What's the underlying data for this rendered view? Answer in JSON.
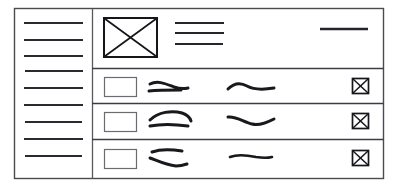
{
  "sketch": {
    "title": "Mobile app list screen wireframe",
    "style": "hand-drawn-lo-fi",
    "background_color": "#ffffff",
    "ink_color": "#18181d",
    "frame": {
      "x": 14,
      "y": 8,
      "width": 370,
      "height": 171
    }
  },
  "sidebar": {
    "name": "navigation-rail",
    "divider_x": 92,
    "menu_item_count": 9,
    "items": [
      {
        "label": "",
        "glyph": "nav-line",
        "y": 23,
        "x1": 24,
        "x2": 83
      },
      {
        "label": "",
        "glyph": "nav-line",
        "y": 40,
        "x1": 24,
        "x2": 83
      },
      {
        "label": "",
        "glyph": "nav-line",
        "y": 56,
        "x1": 24,
        "x2": 83
      },
      {
        "label": "",
        "glyph": "nav-line",
        "y": 71,
        "x1": 25,
        "x2": 83
      },
      {
        "label": "",
        "glyph": "nav-line",
        "y": 88,
        "x1": 24,
        "x2": 83
      },
      {
        "label": "",
        "glyph": "nav-line",
        "y": 105,
        "x1": 24,
        "x2": 83
      },
      {
        "label": "",
        "glyph": "nav-line",
        "y": 122,
        "x1": 25,
        "x2": 82
      },
      {
        "label": "",
        "glyph": "nav-line",
        "y": 139,
        "x1": 24,
        "x2": 83
      },
      {
        "label": "",
        "glyph": "nav-line",
        "y": 156,
        "x1": 25,
        "x2": 82
      }
    ]
  },
  "header": {
    "name": "content-header",
    "region": {
      "x": 92,
      "y": 8,
      "width": 292,
      "height": 60
    },
    "image_placeholder": {
      "name": "image-placeholder",
      "glyph": "crossed-box",
      "x": 104,
      "y": 18,
      "width": 53,
      "height": 39
    },
    "text_lines": [
      {
        "y": 23,
        "x1": 175,
        "x2": 224
      },
      {
        "y": 33,
        "x1": 175,
        "x2": 224
      },
      {
        "y": 44,
        "x1": 175,
        "x2": 223
      }
    ],
    "action_line": {
      "name": "header-action-line",
      "y": 29,
      "x1": 320,
      "x2": 368
    }
  },
  "list": {
    "name": "list-section",
    "row_count": 3,
    "separators_y": [
      68,
      103,
      139,
      178
    ],
    "rows": [
      {
        "name": "list-row",
        "index": 1,
        "thumbnail": {
          "name": "row-thumbnail",
          "x": 104,
          "y": 77,
          "width": 32,
          "height": 19
        },
        "primary_scribbles": [
          {
            "d": "M150 84 C158 80, 166 84, 174 87 C180 89, 184 89, 188 88"
          },
          {
            "d": "M149 91 C158 90, 170 90, 181 90"
          }
        ],
        "secondary_scribbles": [
          {
            "d": "M228 89 C234 83, 240 82, 247 86 C254 90, 262 90, 274 88"
          }
        ],
        "action": {
          "name": "row-action-icon",
          "glyph": "crossed-box",
          "x": 352,
          "y": 78,
          "width": 17,
          "height": 16
        }
      },
      {
        "name": "list-row",
        "index": 2,
        "thumbnail": {
          "name": "row-thumbnail",
          "x": 104,
          "y": 112,
          "width": 32,
          "height": 19
        },
        "primary_scribbles": [
          {
            "d": "M150 120 C158 112, 172 110, 182 113 C188 115, 190 118, 191 121"
          },
          {
            "d": "M150 126 C160 124, 174 124, 188 126"
          }
        ],
        "secondary_scribbles": [
          {
            "d": "M228 117 C236 116, 244 122, 252 124 C260 126, 268 122, 274 119"
          }
        ],
        "action": {
          "name": "row-action-icon",
          "glyph": "crossed-box",
          "x": 352,
          "y": 113,
          "width": 17,
          "height": 16
        }
      },
      {
        "name": "list-row",
        "index": 3,
        "thumbnail": {
          "name": "row-thumbnail",
          "x": 104,
          "y": 149,
          "width": 32,
          "height": 19
        },
        "primary_scribbles": [
          {
            "d": "M152 152 C160 149, 170 149, 182 151"
          },
          {
            "d": "M150 158 C158 161, 166 165, 176 166 C180 166, 184 165, 187 164"
          }
        ],
        "secondary_scribbles": [
          {
            "d": "M230 157 C238 154, 246 155, 256 157 C262 158, 268 158, 272 157"
          }
        ],
        "action": {
          "name": "row-action-icon",
          "glyph": "crossed-box",
          "x": 352,
          "y": 150,
          "width": 17,
          "height": 16
        }
      }
    ]
  }
}
